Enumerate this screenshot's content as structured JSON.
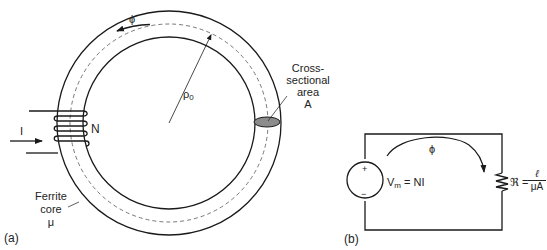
{
  "figure_a": {
    "panel_label": "(a)",
    "flux_symbol": "ϕ",
    "radius_symbol": "ρ",
    "radius_subscript": "0",
    "turns_label": "N",
    "current_label": "I",
    "core_label_line1": "Ferrite",
    "core_label_line2": "core",
    "core_label_line3": "μ",
    "area_label_line1": "Cross-",
    "area_label_line2": "sectional",
    "area_label_line3": "area",
    "area_label_line4": "A"
  },
  "figure_b": {
    "panel_label": "(b)",
    "flux_symbol": "ϕ",
    "source_plus": "+",
    "source_minus": "−",
    "source_label_V": "V",
    "source_label_sub": "m",
    "source_label_rest": " = NI",
    "reluctance_symbol": "ℜ =",
    "reluctance_numerator": "ℓ",
    "reluctance_denominator": "μA"
  },
  "colors": {
    "line": "#1a1a1a",
    "cross_section_fill": "#8c8c8c",
    "dashed": "#555555"
  }
}
